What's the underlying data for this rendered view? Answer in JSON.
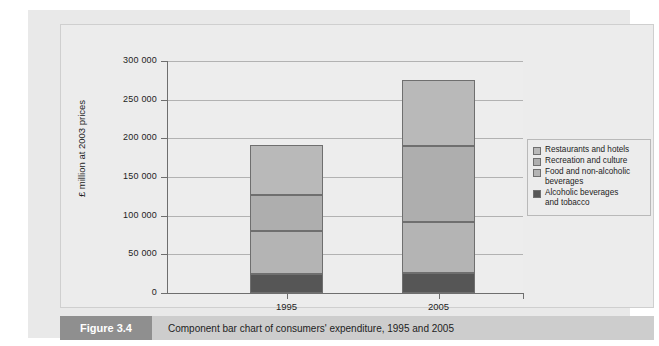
{
  "figure": {
    "badge": "Figure 3.4",
    "caption": "Component bar chart of consumers' expenditure, 1995 and 2005"
  },
  "colors": {
    "restaurants": "#b9b9b9",
    "recreation": "#aeaeae",
    "food": "#b4b4b4",
    "alcohol": "#565656",
    "panel_background": "#e9e9e9",
    "plot_background": "#ededed",
    "axis": "#6e6e6e",
    "gridline": "#b2b2b2",
    "caption_strip": "#cdcdcd",
    "caption_badge": "#8f8f8f"
  },
  "chart_data": {
    "type": "bar",
    "stacked": true,
    "title": "",
    "subtitle": "",
    "xlabel": "",
    "ylabel": "£ million at 2003 prices",
    "categories": [
      "1995",
      "2005"
    ],
    "ylim": [
      0,
      300000
    ],
    "yticks": [
      0,
      50000,
      100000,
      150000,
      200000,
      250000,
      300000
    ],
    "ytick_labels": [
      "0",
      "50 000",
      "100 000",
      "150 000",
      "200 000",
      "250 000",
      "300 000"
    ],
    "grid": true,
    "legend_position": "right",
    "series": [
      {
        "name": "Restaurants and hotels",
        "color": "#b9b9b9",
        "values": [
          65000,
          85000
        ]
      },
      {
        "name": "Recreation and culture",
        "color": "#aeaeae",
        "values": [
          47000,
          98000
        ]
      },
      {
        "name": "Food and non-alcoholic beverages",
        "color": "#b4b4b4",
        "values": [
          55000,
          66000
        ]
      },
      {
        "name": "Alcoholic beverages and tobacco",
        "color": "#565656",
        "values": [
          25000,
          26000
        ]
      }
    ],
    "stack_order_bottom_to_top": [
      "Alcoholic beverages and tobacco",
      "Food and non-alcoholic beverages",
      "Recreation and culture",
      "Restaurants and hotels"
    ],
    "cumulative_tops": {
      "1995": [
        25000,
        80000,
        127000,
        192000
      ],
      "2005": [
        26000,
        92000,
        190000,
        275000
      ]
    },
    "totals": [
      192000,
      275000
    ]
  },
  "legend": {
    "items": [
      {
        "label_line1": "Restaurants and hotels",
        "label_line2": ""
      },
      {
        "label_line1": "Recreation and culture",
        "label_line2": ""
      },
      {
        "label_line1": "Food and non-alcoholic",
        "label_line2": "beverages"
      },
      {
        "label_line1": "Alcoholic beverages",
        "label_line2": "and tobacco"
      }
    ]
  }
}
